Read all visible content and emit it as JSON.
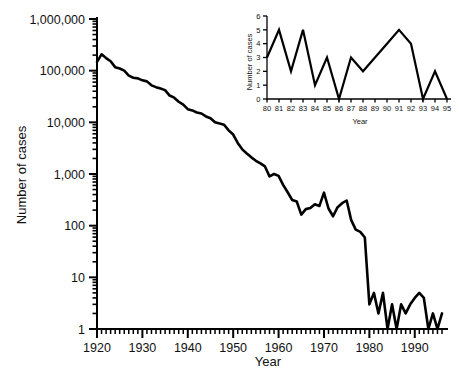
{
  "chart_data": [
    {
      "id": "main",
      "type": "line",
      "title": "",
      "xlabel": "Year",
      "ylabel": "Number of cases",
      "xlim": [
        1920,
        1996
      ],
      "ylim": [
        1,
        1000000
      ],
      "yscale": "log",
      "grid": false,
      "legend": null,
      "ytick_labels": [
        "1",
        "10",
        "100",
        "1,000",
        "10,000",
        "100,000",
        "1,000,000"
      ],
      "ytick_values": [
        1,
        10,
        100,
        1000,
        10000,
        100000,
        1000000
      ],
      "xtick_labels": [
        "1920",
        "1930",
        "1940",
        "1950",
        "1960",
        "1970",
        "1980",
        "1990"
      ],
      "xtick_values": [
        1920,
        1930,
        1940,
        1950,
        1960,
        1970,
        1980,
        1990
      ],
      "minor_ticks": "log decades and yearly x ticks",
      "x": [
        1920,
        1921,
        1922,
        1923,
        1924,
        1925,
        1926,
        1927,
        1928,
        1929,
        1930,
        1931,
        1932,
        1933,
        1934,
        1935,
        1936,
        1937,
        1938,
        1939,
        1940,
        1941,
        1942,
        1943,
        1944,
        1945,
        1946,
        1947,
        1948,
        1949,
        1950,
        1951,
        1952,
        1953,
        1954,
        1955,
        1956,
        1957,
        1958,
        1959,
        1960,
        1961,
        1962,
        1963,
        1964,
        1965,
        1966,
        1967,
        1968,
        1969,
        1970,
        1971,
        1972,
        1973,
        1974,
        1975,
        1976,
        1977,
        1978,
        1979,
        1980,
        1981,
        1982,
        1983,
        1984,
        1985,
        1986,
        1987,
        1988,
        1989,
        1990,
        1991,
        1992,
        1993,
        1994,
        1995,
        1996
      ],
      "values": [
        147991,
        206939,
        175222,
        151842,
        117000,
        110000,
        100399,
        80000,
        73000,
        71000,
        65000,
        62000,
        52000,
        48000,
        45000,
        42000,
        33000,
        30000,
        25000,
        22000,
        18000,
        17000,
        15536,
        14811,
        13000,
        12000,
        10000,
        9500,
        9000,
        7000,
        5796,
        4000,
        3000,
        2500,
        2100,
        1800,
        1600,
        1400,
        900,
        1000,
        918,
        617,
        444,
        314,
        293,
        164,
        209,
        219,
        260,
        241,
        435,
        215,
        152,
        228,
        272,
        307,
        128,
        84,
        76,
        59,
        3,
        5,
        2,
        5,
        1,
        3,
        0,
        3,
        2,
        3,
        4,
        5,
        4,
        0,
        2,
        0,
        2
      ],
      "annotations": []
    },
    {
      "id": "inset",
      "type": "line",
      "title": "",
      "xlabel": "Year",
      "ylabel": "Number of cases",
      "xlim": [
        80,
        95
      ],
      "ylim": [
        0,
        6
      ],
      "yscale": "linear",
      "grid": false,
      "legend": null,
      "ytick_labels": [
        "0",
        "1",
        "2",
        "3",
        "4",
        "5",
        "6"
      ],
      "ytick_values": [
        0,
        1,
        2,
        3,
        4,
        5,
        6
      ],
      "xtick_labels": [
        "80",
        "81",
        "82",
        "83",
        "84",
        "85",
        "86",
        "87",
        "88",
        "89",
        "90",
        "91",
        "92",
        "93",
        "94",
        "95"
      ],
      "xtick_values": [
        80,
        81,
        82,
        83,
        84,
        85,
        86,
        87,
        88,
        89,
        90,
        91,
        92,
        93,
        94,
        95
      ],
      "x": [
        80,
        81,
        82,
        83,
        84,
        85,
        86,
        87,
        88,
        89,
        90,
        91,
        92,
        93,
        94,
        95
      ],
      "values": [
        3,
        5,
        2,
        5,
        1,
        3,
        0,
        3,
        2,
        3,
        4,
        5,
        4,
        0,
        2,
        0
      ],
      "annotations": []
    }
  ],
  "main_chart": {
    "ylabel": "Number of cases",
    "xlabel": "Year"
  },
  "inset_chart": {
    "ylabel": "Number of cases",
    "xlabel": "Year"
  }
}
